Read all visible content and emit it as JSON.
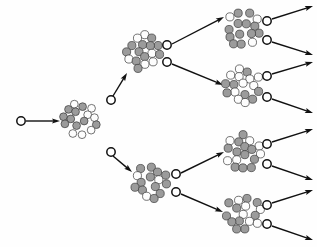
{
  "figure": {
    "background_color": "#fefefe",
    "ink_color": "#111111",
    "proton_color": "#9b9b9b",
    "neutron_color": "#fdfdfd",
    "nucleon_outline_color": "#3a3a3a",
    "canvas": {
      "width": 317,
      "height": 247
    }
  },
  "legend": {
    "nucleus_label": "fissionable nucleus",
    "neutron_label": "free neutron",
    "arrow_label": "neutron track"
  },
  "generations": [
    {
      "index": 0,
      "label": "incident neutron",
      "nucleus_count": 0,
      "neutron_count": 1
    },
    {
      "index": 1,
      "label": "first fission",
      "nucleus_count": 1,
      "neutron_count": 2
    },
    {
      "index": 2,
      "label": "second fission",
      "nucleus_count": 2,
      "neutron_count": 4
    },
    {
      "index": 3,
      "label": "third fission",
      "nucleus_count": 4,
      "neutron_count": 8
    }
  ],
  "nuclei": [
    {
      "id": "nucleus-g1",
      "cx": 80,
      "cy": 120,
      "r": 21,
      "nucleon_count": 30,
      "seed": 11
    },
    {
      "id": "nucleus-g2-top",
      "cx": 143,
      "cy": 52,
      "r": 22,
      "nucleon_count": 32,
      "seed": 23
    },
    {
      "id": "nucleus-g2-bottom",
      "cx": 152,
      "cy": 182,
      "r": 22,
      "nucleon_count": 32,
      "seed": 37
    },
    {
      "id": "nucleus-g3-a",
      "cx": 243,
      "cy": 29,
      "r": 22,
      "nucleon_count": 32,
      "seed": 51
    },
    {
      "id": "nucleus-g3-b",
      "cx": 243,
      "cy": 85,
      "r": 22,
      "nucleon_count": 32,
      "seed": 67
    },
    {
      "id": "nucleus-g3-c",
      "cx": 243,
      "cy": 152,
      "r": 22,
      "nucleon_count": 32,
      "seed": 83
    },
    {
      "id": "nucleus-g3-d",
      "cx": 243,
      "cy": 213,
      "r": 22,
      "nucleon_count": 32,
      "seed": 97
    }
  ],
  "free_neutrons": [
    {
      "id": "neutron-incident",
      "cx": 21,
      "cy": 121,
      "r": 4.2
    },
    {
      "id": "neutron-g1-up",
      "cx": 111,
      "cy": 100,
      "r": 4.2
    },
    {
      "id": "neutron-g1-down",
      "cx": 111,
      "cy": 152,
      "r": 4.2
    },
    {
      "id": "neutron-g2-top-a",
      "cx": 167,
      "cy": 45,
      "r": 4.2
    },
    {
      "id": "neutron-g2-top-b",
      "cx": 167,
      "cy": 62,
      "r": 4.2
    },
    {
      "id": "neutron-g2-bottom-a",
      "cx": 176,
      "cy": 174,
      "r": 4.2
    },
    {
      "id": "neutron-g2-bottom-b",
      "cx": 176,
      "cy": 192,
      "r": 4.2
    },
    {
      "id": "neutron-g3-a-1",
      "cx": 267,
      "cy": 21,
      "r": 4.2
    },
    {
      "id": "neutron-g3-a-2",
      "cx": 267,
      "cy": 40,
      "r": 4.2
    },
    {
      "id": "neutron-g3-b-1",
      "cx": 267,
      "cy": 76,
      "r": 4.2
    },
    {
      "id": "neutron-g3-b-2",
      "cx": 267,
      "cy": 97,
      "r": 4.2
    },
    {
      "id": "neutron-g3-c-1",
      "cx": 267,
      "cy": 144,
      "r": 4.2
    },
    {
      "id": "neutron-g3-c-2",
      "cx": 267,
      "cy": 164,
      "r": 4.2
    },
    {
      "id": "neutron-g3-d-1",
      "cx": 267,
      "cy": 205,
      "r": 4.2
    },
    {
      "id": "neutron-g3-d-2",
      "cx": 267,
      "cy": 224,
      "r": 4.2
    }
  ],
  "tracks": [
    {
      "id": "track-incident",
      "x1": 26,
      "y1": 121,
      "x2": 60,
      "y2": 121,
      "arrow": true
    },
    {
      "id": "track-g1-up-to-g2top",
      "x1": 113,
      "y1": 96,
      "x2": 127,
      "y2": 73,
      "arrow": true
    },
    {
      "id": "track-g1-down-to-g2bottom",
      "x1": 113,
      "y1": 156,
      "x2": 132,
      "y2": 172,
      "arrow": true
    },
    {
      "id": "track-g2top-a",
      "x1": 172,
      "y1": 44,
      "x2": 224,
      "y2": 17,
      "arrow": true
    },
    {
      "id": "track-g2top-b",
      "x1": 172,
      "y1": 64,
      "x2": 223,
      "y2": 85,
      "arrow": true
    },
    {
      "id": "track-g2bottom-a",
      "x1": 181,
      "y1": 173,
      "x2": 224,
      "y2": 152,
      "arrow": true
    },
    {
      "id": "track-g2bottom-b",
      "x1": 181,
      "y1": 194,
      "x2": 223,
      "y2": 212,
      "arrow": true
    },
    {
      "id": "track-g3-a-1",
      "x1": 272,
      "y1": 19,
      "x2": 313,
      "y2": 6,
      "arrow": true
    },
    {
      "id": "track-g3-a-2",
      "x1": 272,
      "y1": 42,
      "x2": 313,
      "y2": 55,
      "arrow": true
    },
    {
      "id": "track-g3-b-1",
      "x1": 272,
      "y1": 74,
      "x2": 313,
      "y2": 62,
      "arrow": true
    },
    {
      "id": "track-g3-b-2",
      "x1": 272,
      "y1": 99,
      "x2": 313,
      "y2": 113,
      "arrow": true
    },
    {
      "id": "track-g3-c-1",
      "x1": 272,
      "y1": 142,
      "x2": 313,
      "y2": 129,
      "arrow": true
    },
    {
      "id": "track-g3-c-2",
      "x1": 272,
      "y1": 166,
      "x2": 313,
      "y2": 180,
      "arrow": true
    },
    {
      "id": "track-g3-d-1",
      "x1": 272,
      "y1": 203,
      "x2": 313,
      "y2": 190,
      "arrow": true
    },
    {
      "id": "track-g3-d-2",
      "x1": 272,
      "y1": 226,
      "x2": 313,
      "y2": 240,
      "arrow": true
    }
  ]
}
